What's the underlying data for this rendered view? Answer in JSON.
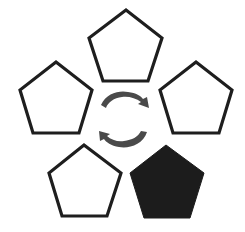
{
  "diagram": {
    "background": "#ffffff",
    "stroke_color": "#1e1e1e",
    "filled_color": "#1c1c1c",
    "arrow_color": "#555555",
    "pentagons": [
      {
        "id": "top",
        "filled": false,
        "points": "126,10 162,38 148,81 103,81 89,38"
      },
      {
        "id": "left",
        "filled": false,
        "points": "56,62 92,90 79,133 33,133 20,90"
      },
      {
        "id": "right",
        "filled": false,
        "points": "196,62 232,90 219,133 173,133 160,90"
      },
      {
        "id": "bottom-left",
        "filled": false,
        "points": "84,145 121,173 107,216 62,216 49,173"
      },
      {
        "id": "bottom-right",
        "filled": true,
        "points": "166,145 204,173 190,218 144,218 130,173"
      }
    ],
    "arrows": [
      {
        "id": "upper-arrow",
        "direction": "clockwise-right"
      },
      {
        "id": "lower-arrow",
        "direction": "counterclockwise-left"
      }
    ]
  }
}
